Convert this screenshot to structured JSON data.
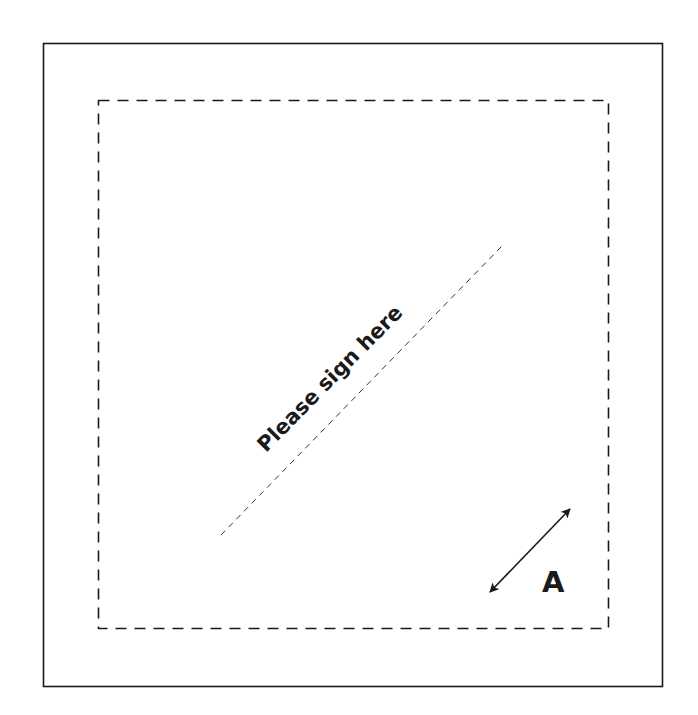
{
  "diagram": {
    "signature_prompt": "Please sign here",
    "dimension_label": "A",
    "colors": {
      "background": "#ffffff",
      "stroke": "#1a1a1a"
    }
  }
}
